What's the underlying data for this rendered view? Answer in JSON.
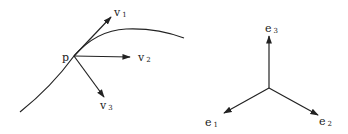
{
  "diagram": {
    "left": {
      "point_label": "p",
      "vectors": [
        {
          "name": "v",
          "sub": "1"
        },
        {
          "name": "v",
          "sub": "2"
        },
        {
          "name": "v",
          "sub": "3"
        }
      ]
    },
    "right": {
      "basis": [
        {
          "name": "e",
          "sub": "1"
        },
        {
          "name": "e",
          "sub": "2"
        },
        {
          "name": "e",
          "sub": "3"
        }
      ]
    },
    "colors": {
      "ink": "#222222",
      "background": "#ffffff"
    }
  }
}
